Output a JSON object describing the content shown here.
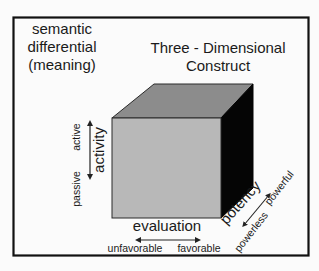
{
  "diagram": {
    "left_title": [
      "semantic",
      "differential",
      "(meaning)"
    ],
    "right_title": [
      "Three - Dimensional",
      "Construct"
    ],
    "cube": {
      "front_color": "#b8b8b8",
      "top_color": "#8c8c8c",
      "side_color": "#050505",
      "edge_color": "#2a2a2a"
    },
    "axes": {
      "activity": {
        "label": "activity",
        "pole_high": "active",
        "pole_low": "passive"
      },
      "evaluation": {
        "label": "evaluation",
        "pole_low": "unfavorable",
        "pole_high": "favorable"
      },
      "potency": {
        "label": "potency",
        "pole_high": "powerful",
        "pole_low": "powerless"
      }
    },
    "frame_color": "#111111",
    "background_color": "#fbfbfb"
  }
}
